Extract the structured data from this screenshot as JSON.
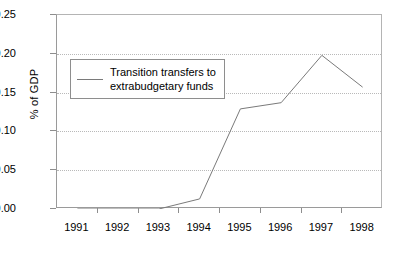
{
  "chart_data": {
    "type": "line",
    "title": "",
    "xlabel": "",
    "ylabel": "% of GDP",
    "categories": [
      "1991",
      "1992",
      "1993",
      "1994",
      "1995",
      "1996",
      "1997",
      "1998"
    ],
    "series": [
      {
        "name": "Transition transfers to extrabudgetary funds",
        "values": [
          0.0,
          0.0,
          0.0,
          0.013,
          0.129,
          0.137,
          0.198,
          0.157
        ],
        "color": "#7a7a7a"
      }
    ],
    "ylim": [
      0.0,
      0.25
    ],
    "ytick_values": [
      0.0,
      0.05,
      0.1,
      0.15,
      0.2,
      0.25
    ],
    "ytick_labels": [
      "0.00",
      "0.05",
      "0.10",
      "0.15",
      "0.20",
      "0.25"
    ],
    "grid": true,
    "grid_color": "#b9b9b9",
    "legend_position": "upper left",
    "legend_entries": [
      "Transition transfers to\nextrabudgetary funds"
    ],
    "frame_color": "#9a9a9a",
    "background": "#ffffff"
  }
}
